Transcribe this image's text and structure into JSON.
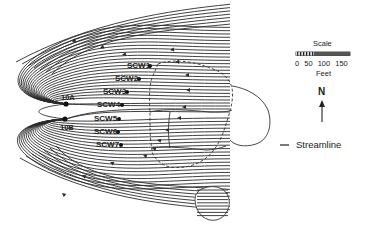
{
  "wells": [
    {
      "id": "SCW1",
      "label": "SCW1",
      "x": 150,
      "y": 66
    },
    {
      "id": "SCW2",
      "label": "SCW2",
      "x": 139,
      "y": 79
    },
    {
      "id": "SCW3",
      "label": "SCW3",
      "x": 127,
      "y": 92
    },
    {
      "id": "SCW4",
      "label": "SCW4",
      "x": 122,
      "y": 105
    },
    {
      "id": "SCW5",
      "label": "SCW5",
      "x": 119,
      "y": 119
    },
    {
      "id": "SCW6",
      "label": "SCW6",
      "x": 118,
      "y": 132
    },
    {
      "id": "SCW7",
      "label": "SCW7",
      "x": 121,
      "y": 145
    }
  ],
  "extraction_wells": [
    {
      "id": "10A",
      "label": "10A",
      "x": 66,
      "y": 104
    },
    {
      "id": "10B",
      "label": "10B",
      "x": 65,
      "y": 119
    }
  ],
  "scale": {
    "title": "Scale",
    "ticks": "0 50 100 150",
    "unit": "Feet"
  },
  "north_arrow": {
    "label": "N"
  },
  "legend": {
    "streamline_label": "Streamline"
  },
  "colors": {
    "line": "#2a2a2a",
    "background": "#ffffff"
  }
}
